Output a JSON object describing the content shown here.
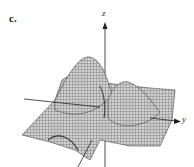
{
  "figure": {
    "panel_label": "c.",
    "axes": {
      "z": "z",
      "y": "y",
      "x": ""
    },
    "colors": {
      "surface": "#c8c8c8",
      "mesh": "#555555",
      "axis": "#222222"
    }
  }
}
